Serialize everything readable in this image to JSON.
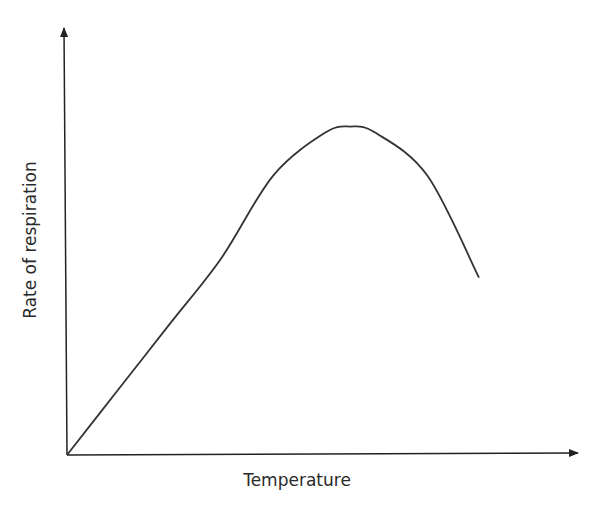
{
  "chart_data": {
    "type": "line",
    "title": "",
    "xlabel": "Temperature",
    "ylabel": "Rate of respiration",
    "grid": false,
    "legend": null,
    "axes_style": "arrows, no ticks or tick labels",
    "series": [
      {
        "name": "Rate of respiration",
        "x": [
          0,
          0.1,
          0.2,
          0.3,
          0.4,
          0.5,
          0.55,
          0.6,
          0.7,
          0.8
        ],
        "values": [
          0,
          0.2,
          0.4,
          0.6,
          0.85,
          0.98,
          1.0,
          0.98,
          0.85,
          0.54
        ]
      }
    ],
    "xlim": [
      0,
      1
    ],
    "ylim": [
      0,
      1.3
    ],
    "annotations": [],
    "colors": {
      "line": "#333333",
      "axes": "#222222"
    }
  }
}
